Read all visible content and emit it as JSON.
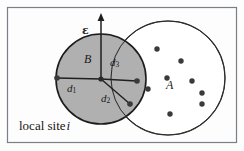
{
  "figure": {
    "caption_text": "local site",
    "site_index": "i",
    "labels": {
      "epsilon": "ε",
      "ball_center": "B",
      "distance_1": "d",
      "distance_1_sub": "1",
      "distance_2": "d",
      "distance_2_sub": "2",
      "distance_3": "d",
      "distance_3_sub": "3",
      "point_set": "A"
    },
    "colors": {
      "shaded_fill": "#a9a9a9",
      "shaded_stroke": "#1c1c1c",
      "open_fill": "#ffffff",
      "open_stroke": "#262626",
      "frame_stroke": "#7a7f86",
      "point_fill": "#3a3a3a",
      "line_stroke": "#1f1f1f",
      "background": "#fdfdfd"
    },
    "geometry": {
      "frame": {
        "x": 7,
        "y": 7,
        "width": 230,
        "height": 136
      },
      "shaded_circle": {
        "cx": 101,
        "cy": 79,
        "r": 45
      },
      "open_circle": {
        "cx": 168,
        "cy": 78,
        "r": 57
      },
      "center_point": {
        "x": 101,
        "y": 79
      },
      "epsilon_arrow": {
        "x1": 101,
        "y1": 79,
        "x2": 101,
        "y2": 15
      },
      "d1_endpoint": {
        "x": 57,
        "y": 78
      },
      "d3_endpoint": {
        "x": 137,
        "y": 81
      },
      "d2_endpoint": {
        "x": 130,
        "y": 104
      },
      "point_radius": 2.6,
      "points": [
        {
          "x": 157,
          "y": 49
        },
        {
          "x": 181,
          "y": 61
        },
        {
          "x": 167,
          "y": 78
        },
        {
          "x": 192,
          "y": 81
        },
        {
          "x": 202,
          "y": 93
        },
        {
          "x": 202,
          "y": 104
        },
        {
          "x": 170,
          "y": 114
        },
        {
          "x": 148,
          "y": 89
        }
      ]
    }
  }
}
